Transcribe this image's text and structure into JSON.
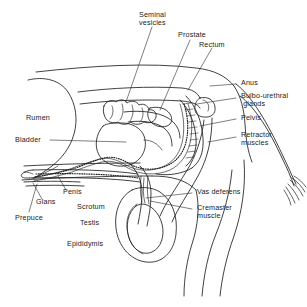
{
  "figure": {
    "kind": "anatomical-line-diagram",
    "background_color": "#ffffff",
    "line_color": "#1f1f1f",
    "text_color": "#1a1a1a"
  },
  "labels": {
    "seminal_vesicles": "Seminal\nvesicles",
    "prostate": "Prostate",
    "rectum": "Rectum",
    "anus": "Anus",
    "bulbo_urethral_glands": "Bulbo-urethral\n glands",
    "pelvis": "Pelvis",
    "retractor_muscles": "Retractor\nmuscles",
    "vas_deferens": "Vas deferens",
    "cremaster_muscle": "Cremaster\nmuscle",
    "rumen": "Rumen",
    "bladder": "Bladder",
    "penis": "Penis",
    "glans": "Glans",
    "prepuce": "Prepuce",
    "scrotum": "Scrotum",
    "testis": "Testis",
    "epididymis": "Epididymis"
  }
}
